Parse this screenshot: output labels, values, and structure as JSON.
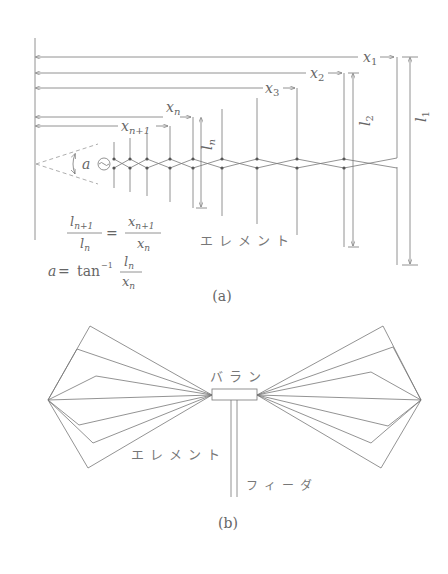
{
  "diagram_a": {
    "caption": "(a)",
    "dimension_labels": {
      "x1": "x",
      "x1_sub": "1",
      "x2": "x",
      "x2_sub": "2",
      "x3": "x",
      "x3_sub": "3",
      "xn": "x",
      "xn_sub": "n",
      "xn1": "x",
      "xn1_sub": "n+1",
      "l1": "l",
      "l1_sub": "1",
      "l2": "l",
      "l2_sub": "2",
      "ln": "l",
      "ln_sub": "n"
    },
    "angle_label": "a",
    "element_label": "エレメント",
    "formula_ratio": {
      "lhs_num": "l",
      "lhs_num_sub": "n+1",
      "lhs_den": "l",
      "lhs_den_sub": "n",
      "equals": "=",
      "rhs_num": "x",
      "rhs_num_sub": "n+1",
      "rhs_den": "x",
      "rhs_den_sub": "n"
    },
    "formula_angle": {
      "lhs": "a",
      "equals": "=",
      "func": "tan",
      "exp": "−1",
      "num": "l",
      "num_sub": "n",
      "den": "x",
      "den_sub": "n"
    },
    "element_positions_x": [
      114,
      130,
      147,
      170,
      193,
      222,
      257,
      297,
      344,
      397
    ]
  },
  "diagram_b": {
    "caption": "(b)",
    "balun_label": "バラン",
    "element_label": "エレメント",
    "feeder_label": "フィーダ"
  }
}
